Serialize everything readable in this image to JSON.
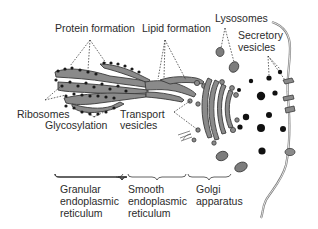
{
  "diagram": {
    "type": "biological-illustration",
    "labels": {
      "protein_formation": "Protein formation",
      "lipid_formation": "Lipid formation",
      "lysosomes": "Lysosomes",
      "secretory_vesicles_line1": "Secretory",
      "secretory_vesicles_line2": "vesicles",
      "ribosomes": "Ribosomes",
      "glycosylation": "Glycosylation",
      "transport_vesicles_line1": "Transport",
      "transport_vesicles_line2": "vesicles"
    },
    "sections": [
      {
        "id": "granular-er",
        "line1": "Granular",
        "line2": "endoplasmic",
        "line3": "reticulum"
      },
      {
        "id": "smooth-er",
        "line1": "Smooth",
        "line2": "endoplasmic",
        "line3": "reticulum"
      },
      {
        "id": "golgi",
        "line1": "Golgi",
        "line2": "apparatus"
      }
    ],
    "colors": {
      "organelle_fill": "#8a8a8a",
      "outline": "#3a3a3a",
      "ribosome": "#1a1a1a",
      "secretory_vesicle": "#111111",
      "text": "#2b2b2b",
      "background": "#ffffff"
    }
  }
}
